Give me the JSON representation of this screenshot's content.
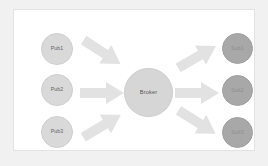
{
  "diagram": {
    "background_color": "#f1f1f1",
    "panel_color": "#ffffff",
    "panel_border_color": "#e3e3e3",
    "publishers": [
      {
        "id": "pub1",
        "label": "Pub1",
        "color": "#d9d9d9"
      },
      {
        "id": "pub2",
        "label": "Pub2",
        "color": "#d9d9d9"
      },
      {
        "id": "pub3",
        "label": "Pub3",
        "color": "#d9d9d9"
      }
    ],
    "broker": {
      "id": "broker",
      "label": "Broker",
      "color": "#d6d6d6"
    },
    "subscribers": [
      {
        "id": "sub1",
        "label": "Sub1",
        "color": "#a8a8a8"
      },
      {
        "id": "sub2",
        "label": "Sub2",
        "color": "#a8a8a8"
      },
      {
        "id": "sub3",
        "label": "Sub3",
        "color": "#a8a8a8"
      }
    ],
    "arrows": [
      {
        "id": "arrow-pub1",
        "from": "Pub1",
        "to": "Broker",
        "direction": "down-right",
        "color": "#e2e2e2"
      },
      {
        "id": "arrow-pub2",
        "from": "Pub2",
        "to": "Broker",
        "direction": "right",
        "color": "#e2e2e2"
      },
      {
        "id": "arrow-pub3",
        "from": "Pub3",
        "to": "Broker",
        "direction": "up-right",
        "color": "#e2e2e2"
      },
      {
        "id": "arrow-sub1",
        "from": "Broker",
        "to": "Sub1",
        "direction": "up-right",
        "color": "#e2e2e2"
      },
      {
        "id": "arrow-sub2",
        "from": "Broker",
        "to": "Sub2",
        "direction": "right",
        "color": "#e2e2e2"
      },
      {
        "id": "arrow-sub3",
        "from": "Broker",
        "to": "Sub3",
        "direction": "down-right",
        "color": "#e2e2e2"
      }
    ]
  }
}
